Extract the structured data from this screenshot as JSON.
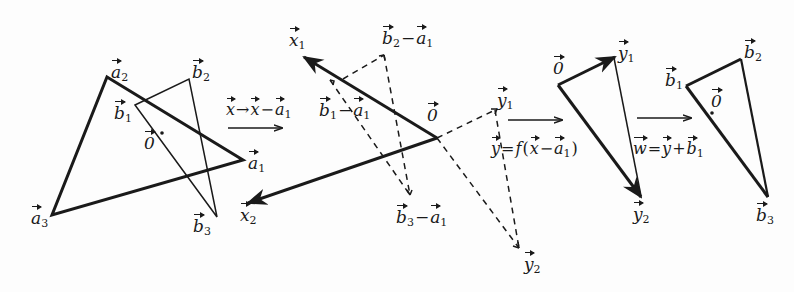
{
  "diagram": {
    "type": "vector-triangle-transformation",
    "panels": [
      {
        "id": "original",
        "labels": {
          "a1": "a",
          "a1_sub": "1",
          "a2": "a",
          "a2_sub": "2",
          "a3": "a",
          "a3_sub": "3",
          "b1": "b",
          "b1_sub": "1",
          "b2": "b",
          "b2_sub": "2",
          "b3": "b",
          "b3_sub": "3",
          "origin": "0"
        }
      },
      {
        "id": "translated",
        "labels": {
          "x1": "x",
          "x1_sub": "1",
          "x2": "x",
          "x2_sub": "2",
          "origin": "0",
          "b1_minus_a1": {
            "b": "b",
            "b_sub": "1",
            "minus": "−",
            "a": "a",
            "a_sub": "1"
          },
          "b2_minus_a1": {
            "b": "b",
            "b_sub": "2",
            "minus": "−",
            "a": "a",
            "a_sub": "1"
          },
          "b3_minus_a1": {
            "b": "b",
            "b_sub": "3",
            "minus": "−",
            "a": "a",
            "a_sub": "1"
          },
          "y1": "y",
          "y1_sub": "1",
          "y2": "y",
          "y2_sub": "2"
        }
      },
      {
        "id": "mapped",
        "labels": {
          "origin": "0",
          "y1": "y",
          "y1_sub": "1",
          "y2": "y",
          "y2_sub": "2"
        }
      },
      {
        "id": "result",
        "labels": {
          "b1": "b",
          "b1_sub": "1",
          "b2": "b",
          "b2_sub": "2",
          "b3": "b",
          "b3_sub": "3",
          "origin": "0"
        }
      }
    ],
    "transforms": [
      {
        "id": "t1",
        "from": "x",
        "arrow": "→",
        "to": "x",
        "minus": "−",
        "a": "a",
        "a_sub": "1"
      },
      {
        "id": "t2",
        "y": "y",
        "eq": "=",
        "f": "f",
        "open": "(",
        "x": "x",
        "minus": "−",
        "a": "a",
        "a_sub": "1",
        "close": ")"
      },
      {
        "id": "t3",
        "w": "w",
        "eq": "=",
        "y": "y",
        "plus": "+",
        "b": "b",
        "b_sub": "1"
      }
    ],
    "colors": {
      "stroke": "#1a1a1a",
      "background": "#fdfdfd"
    }
  }
}
